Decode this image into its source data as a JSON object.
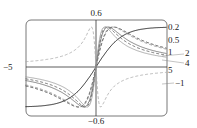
{
  "chart_data": {
    "type": "line",
    "title": "",
    "xlabel": "",
    "ylabel": "",
    "xlim": [
      -5,
      5
    ],
    "ylim": [
      -0.6,
      0.6
    ],
    "tick_labels": {
      "x_left": "-5",
      "x_right": "5",
      "y_top": "0.6",
      "y_bottom": "-0.6"
    },
    "grid": false,
    "series": [
      {
        "name": "0.2",
        "style": "solid",
        "color": "#000000"
      },
      {
        "name": "0.5",
        "style": "solid",
        "color": "#666666"
      },
      {
        "name": "1",
        "style": "dashed",
        "color": "#333333"
      },
      {
        "name": "2",
        "style": "dashed",
        "color": "#888888"
      },
      {
        "name": "4",
        "style": "dashed",
        "color": "#555555"
      },
      {
        "name": "5",
        "style": "solid",
        "color": "#999999"
      },
      {
        "name": "-1",
        "style": "dashed",
        "color": "#aaaaaa"
      }
    ],
    "annotations": [
      "0.2",
      "0.5",
      "1",
      "2",
      "4",
      "5",
      "-1"
    ]
  },
  "labels": {
    "y_top": "0.6",
    "y_bottom": "−0.6",
    "x_left": "−5",
    "x_right": "5",
    "c1": "0.2",
    "c2": "0.5",
    "c3": "1",
    "c4": "2",
    "c5": "4",
    "c6": "5",
    "c7": "−1"
  }
}
